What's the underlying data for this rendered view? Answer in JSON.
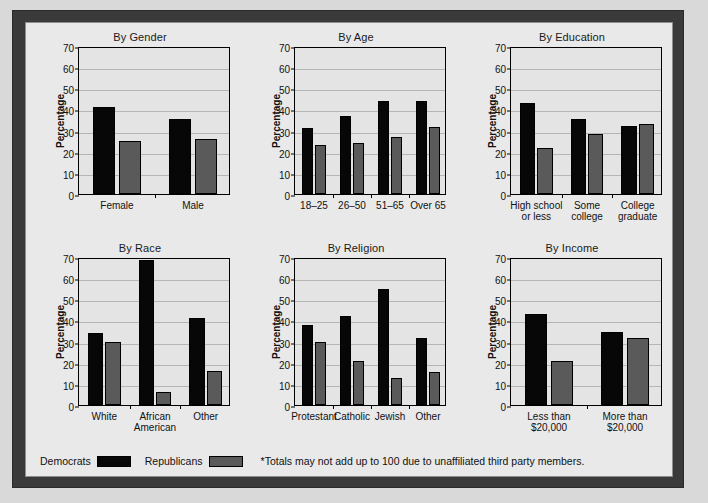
{
  "figure": {
    "legend": {
      "democrats_label": "Democrats",
      "republicans_label": "Republicans",
      "footnote": "*Totals may not add up to 100 due to unaffiliated third party members.",
      "democrat_color": "#070707",
      "republican_color": "#5a5a5a"
    },
    "shared": {
      "ylabel": "Percentage",
      "ylim": [
        0,
        70
      ],
      "yticks": [
        0,
        10,
        20,
        30,
        40,
        50,
        60,
        70
      ]
    }
  },
  "chart_data": [
    {
      "type": "bar",
      "title": "By Gender",
      "xlabel": "",
      "ylabel": "Percentage",
      "ylim": [
        0,
        70
      ],
      "yticks": [
        0,
        10,
        20,
        30,
        40,
        50,
        60,
        70
      ],
      "grid": true,
      "legend_position": "figure-bottom",
      "categories": [
        "Female",
        "Male"
      ],
      "series": [
        {
          "name": "Democrats",
          "color": "#070707",
          "values": [
            41,
            35.5
          ]
        },
        {
          "name": "Republicans",
          "color": "#5a5a5a",
          "values": [
            25,
            26
          ]
        }
      ]
    },
    {
      "type": "bar",
      "title": "By Age",
      "xlabel": "",
      "ylabel": "Percentage",
      "ylim": [
        0,
        70
      ],
      "yticks": [
        0,
        10,
        20,
        30,
        40,
        50,
        60,
        70
      ],
      "grid": true,
      "legend_position": "figure-bottom",
      "categories": [
        "18–25",
        "26–50",
        "51–65",
        "Over 65"
      ],
      "series": [
        {
          "name": "Democrats",
          "color": "#070707",
          "values": [
            31,
            37,
            44,
            44
          ]
        },
        {
          "name": "Republicans",
          "color": "#5a5a5a",
          "values": [
            23,
            24,
            27,
            31.5
          ]
        }
      ]
    },
    {
      "type": "bar",
      "title": "By Education",
      "xlabel": "",
      "ylabel": "Percentage",
      "ylim": [
        0,
        70
      ],
      "yticks": [
        0,
        10,
        20,
        30,
        40,
        50,
        60,
        70
      ],
      "grid": true,
      "legend_position": "figure-bottom",
      "categories": [
        "High school\nor less",
        "Some\ncollege",
        "College\ngraduate"
      ],
      "series": [
        {
          "name": "Democrats",
          "color": "#070707",
          "values": [
            43,
            35.5,
            32
          ]
        },
        {
          "name": "Republicans",
          "color": "#5a5a5a",
          "values": [
            22,
            28.5,
            33
          ]
        }
      ]
    },
    {
      "type": "bar",
      "title": "By Race",
      "xlabel": "",
      "ylabel": "Percentage",
      "ylim": [
        0,
        70
      ],
      "yticks": [
        0,
        10,
        20,
        30,
        40,
        50,
        60,
        70
      ],
      "grid": true,
      "legend_position": "figure-bottom",
      "categories": [
        "White",
        "African\nAmerican",
        "Other"
      ],
      "series": [
        {
          "name": "Democrats",
          "color": "#070707",
          "values": [
            34,
            68.5,
            41
          ]
        },
        {
          "name": "Republicans",
          "color": "#5a5a5a",
          "values": [
            30,
            6,
            16
          ]
        }
      ]
    },
    {
      "type": "bar",
      "title": "By Religion",
      "xlabel": "",
      "ylabel": "Percentage",
      "ylim": [
        0,
        70
      ],
      "yticks": [
        0,
        10,
        20,
        30,
        40,
        50,
        60,
        70
      ],
      "grid": true,
      "legend_position": "figure-bottom",
      "categories": [
        "Protestant",
        "Catholic",
        "Jewish",
        "Other"
      ],
      "series": [
        {
          "name": "Democrats",
          "color": "#070707",
          "values": [
            38,
            42,
            55,
            31.5
          ]
        },
        {
          "name": "Republicans",
          "color": "#5a5a5a",
          "values": [
            30,
            21,
            13,
            15.5
          ]
        }
      ]
    },
    {
      "type": "bar",
      "title": "By Income",
      "xlabel": "",
      "ylabel": "Percentage",
      "ylim": [
        0,
        70
      ],
      "yticks": [
        0,
        10,
        20,
        30,
        40,
        50,
        60,
        70
      ],
      "grid": true,
      "legend_position": "figure-bottom",
      "categories": [
        "Less than\n$20,000",
        "More than\n$20,000"
      ],
      "series": [
        {
          "name": "Democrats",
          "color": "#070707",
          "values": [
            43,
            34.5
          ]
        },
        {
          "name": "Republicans",
          "color": "#5a5a5a",
          "values": [
            21,
            31.5
          ]
        }
      ]
    }
  ]
}
